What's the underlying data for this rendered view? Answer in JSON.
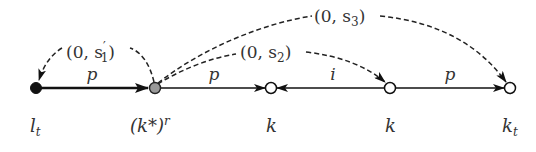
{
  "nodes": [
    {
      "id": "lt",
      "label_main": "l",
      "label_sub": "t",
      "fill": "#111111"
    },
    {
      "id": "kstar_r",
      "label_main": "(k*)",
      "label_sup": "r",
      "fill": "#999999"
    },
    {
      "id": "k1",
      "label_main": "k",
      "fill": "#ffffff"
    },
    {
      "id": "k2",
      "label_main": "k",
      "fill": "#ffffff"
    },
    {
      "id": "kt",
      "label_main": "k",
      "label_sub": "t",
      "fill": "#ffffff"
    }
  ],
  "edges": [
    {
      "from": "lt",
      "to": "kstar_r",
      "label": "p",
      "style": "solid-thick"
    },
    {
      "from": "kstar_r",
      "to": "k1",
      "label": "p",
      "style": "solid"
    },
    {
      "from": "k2",
      "to": "k1",
      "label": "i",
      "style": "solid"
    },
    {
      "from": "k2",
      "to": "kt",
      "label": "p",
      "style": "solid"
    }
  ],
  "arcs": [
    {
      "from": "kstar_r",
      "to": "lt",
      "label_open": "(0, s",
      "label_sub": "1",
      "label_prime": "′",
      "label_close": ")",
      "style": "dashed"
    },
    {
      "from": "kstar_r",
      "to": "k2",
      "label_open": "(0, s",
      "label_sub": "2",
      "label_close": ")",
      "style": "dashed"
    },
    {
      "from": "kstar_r",
      "to": "kt",
      "label_open": "(0, s",
      "label_sub": "3",
      "label_close": ")",
      "style": "dashed"
    }
  ]
}
